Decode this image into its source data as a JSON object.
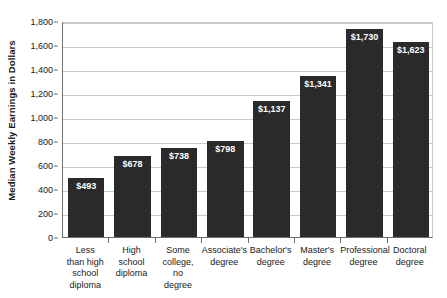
{
  "chart_data": {
    "type": "bar",
    "title": "",
    "xlabel": "",
    "ylabel": "Median Weekly Earnings in Dollars",
    "ylim": [
      0,
      1800
    ],
    "ytick_step": 200,
    "grid": true,
    "legend": "none",
    "bar_color": "#2a2a2a",
    "gridline_color": "#c9c9c9",
    "axis_color": "#6e6e6e",
    "value_label_color": "#ffffff",
    "categories": [
      "Less than high school diploma",
      "High school diploma",
      "Some college, no degree",
      "Associate's degree",
      "Bachelor's degree",
      "Master's degree",
      "Professional degree",
      "Doctoral degree"
    ],
    "category_lines": [
      [
        "Less",
        "than high",
        "school",
        "diploma"
      ],
      [
        "High",
        "school",
        "diploma"
      ],
      [
        "Some",
        "college,",
        "no",
        "degree"
      ],
      [
        "Associate's",
        "degree"
      ],
      [
        "Bachelor's",
        "degree"
      ],
      [
        "Master's",
        "degree"
      ],
      [
        "Professional",
        "degree"
      ],
      [
        "Doctoral",
        "degree"
      ]
    ],
    "values": [
      493,
      678,
      738,
      798,
      1137,
      1341,
      1730,
      1623
    ],
    "value_labels": [
      "$493",
      "$678",
      "$738",
      "$798",
      "$1,137",
      "$1,341",
      "$1,730",
      "$1,623"
    ],
    "ytick_labels": [
      "0",
      "200",
      "400",
      "600",
      "800",
      "1,000",
      "1,200",
      "1,400",
      "1,600",
      "1,800"
    ],
    "ytick_values": [
      0,
      200,
      400,
      600,
      800,
      1000,
      1200,
      1400,
      1600,
      1800
    ]
  }
}
